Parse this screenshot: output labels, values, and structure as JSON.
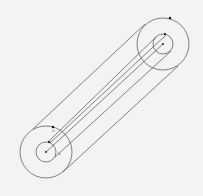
{
  "diagram": {
    "type": "coaxial-cylinder",
    "stroke_color": "#333333",
    "background": "#f3f3f3",
    "ends": [
      {
        "name": "near-end",
        "cx": 46,
        "cy": 152,
        "r_outer": 26,
        "r_inner": 10
      },
      {
        "name": "far-end",
        "cx": 163,
        "cy": 44,
        "r_outer": 26,
        "r_inner": 10
      }
    ],
    "labels": [
      {
        "text": "a",
        "x": 52,
        "y": 131
      },
      {
        "text": "b",
        "x": 58,
        "y": 154
      }
    ]
  }
}
